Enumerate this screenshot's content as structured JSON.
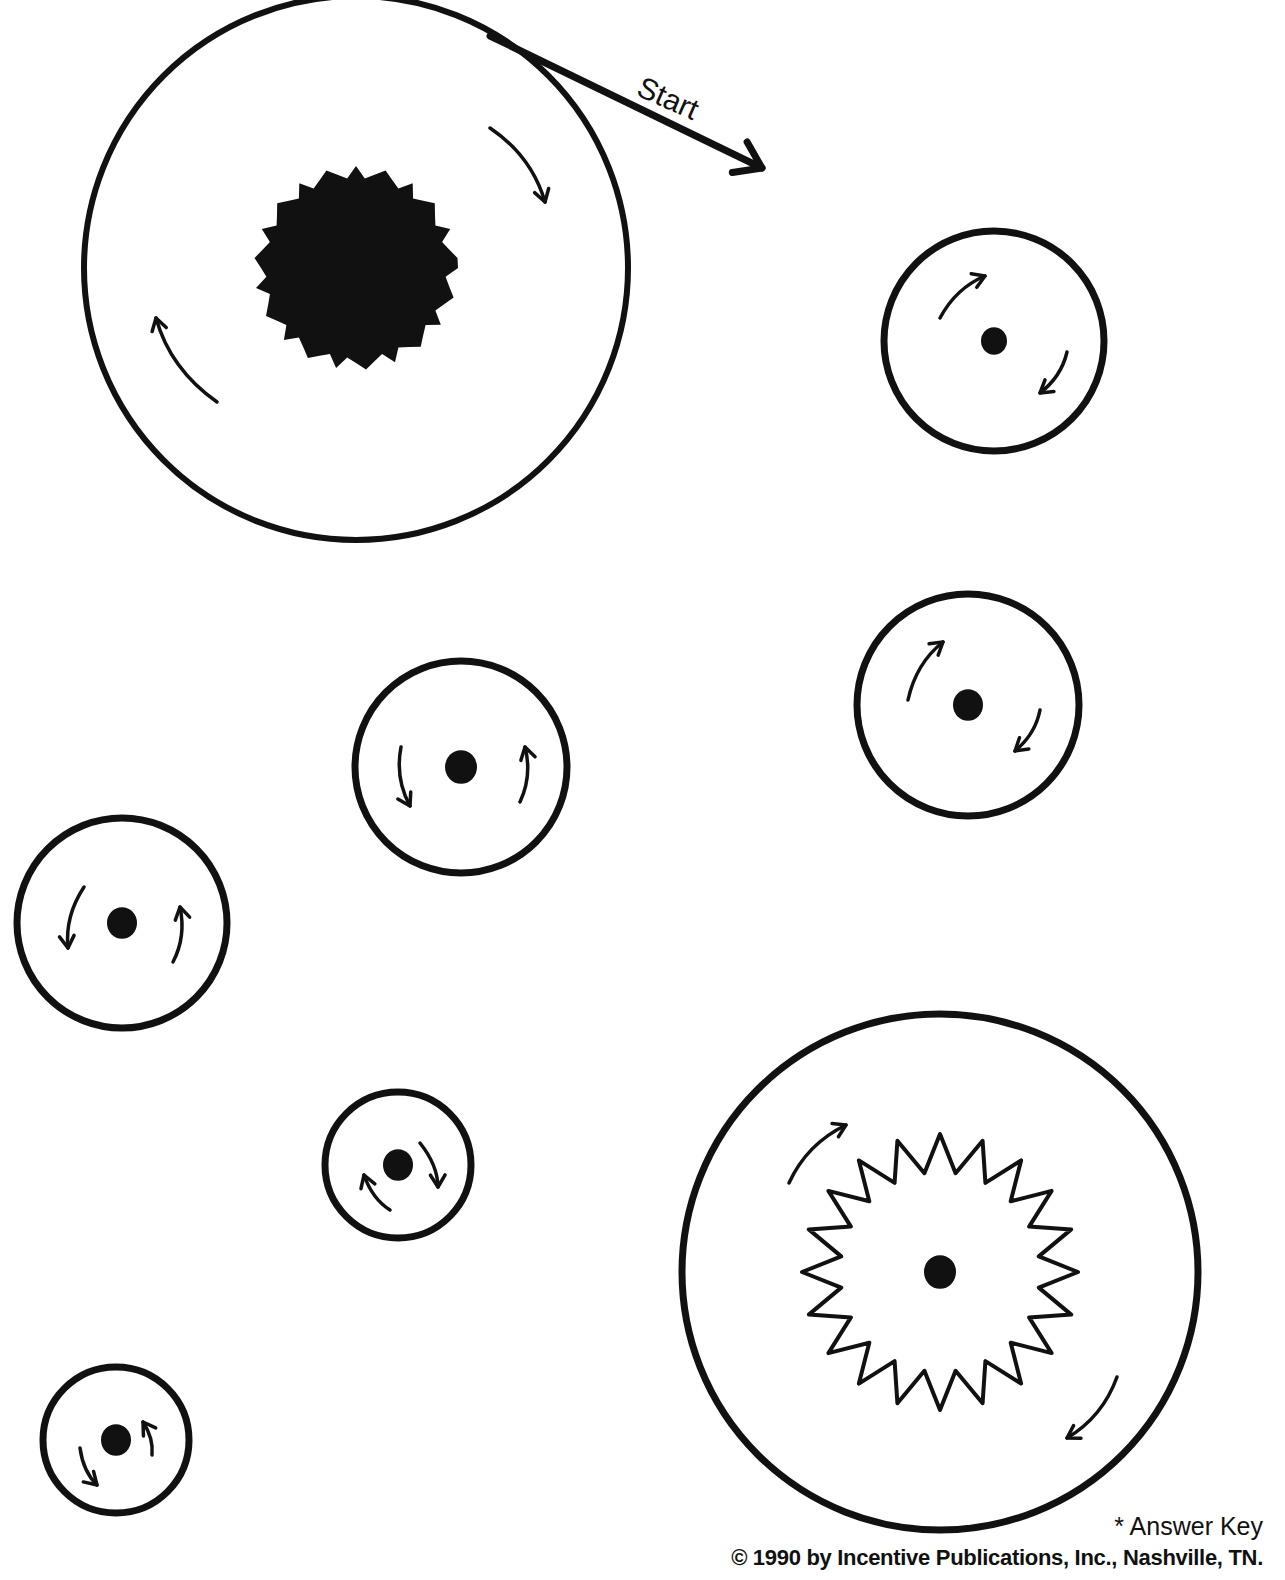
{
  "page": {
    "type": "maze-worksheet",
    "start_label": "Start",
    "answer_key_label": "* Answer Key",
    "copyright": "© 1990 by Incentive Publications, Inc., Nashville, TN."
  },
  "colors": {
    "ink": "#111111",
    "paper": "#ffffff"
  },
  "circles": [
    {
      "id": "large-top-left",
      "cx": 356,
      "cy": 268,
      "r": 272,
      "stroke": 6,
      "center": "fuzzy-blob",
      "center_r": 92,
      "arrows": [
        {
          "dir": "cw",
          "from": [
            490,
            128
          ],
          "to": [
            545,
            202
          ]
        },
        {
          "dir": "cw",
          "from": [
            217,
            402
          ],
          "to": [
            156,
            318
          ]
        }
      ]
    },
    {
      "id": "medium-right-1",
      "cx": 994,
      "cy": 341,
      "r": 110,
      "stroke": 7,
      "center": "dot",
      "center_r": 13,
      "arrows": [
        {
          "dir": "cw",
          "from": [
            940,
            318
          ],
          "to": [
            985,
            276
          ]
        },
        {
          "dir": "cw",
          "from": [
            1067,
            352
          ],
          "to": [
            1040,
            393
          ]
        }
      ]
    },
    {
      "id": "medium-right-2",
      "cx": 968,
      "cy": 705,
      "r": 111,
      "stroke": 7,
      "center": "dot",
      "center_r": 15,
      "arrows": [
        {
          "dir": "cw",
          "from": [
            908,
            700
          ],
          "to": [
            943,
            642
          ]
        },
        {
          "dir": "cw",
          "from": [
            1040,
            710
          ],
          "to": [
            1015,
            751
          ]
        }
      ]
    },
    {
      "id": "medium-center",
      "cx": 461,
      "cy": 767,
      "r": 106,
      "stroke": 7,
      "center": "dot",
      "center_r": 16,
      "arrows": [
        {
          "dir": "ccw",
          "from": [
            401,
            747
          ],
          "to": [
            410,
            806
          ]
        },
        {
          "dir": "ccw",
          "from": [
            520,
            802
          ],
          "to": [
            525,
            747
          ]
        }
      ]
    },
    {
      "id": "medium-left",
      "cx": 122,
      "cy": 923,
      "r": 105,
      "stroke": 7,
      "center": "dot",
      "center_r": 15,
      "arrows": [
        {
          "dir": "ccw",
          "from": [
            84,
            887
          ],
          "to": [
            68,
            948
          ]
        },
        {
          "dir": "ccw",
          "from": [
            173,
            962
          ],
          "to": [
            180,
            907
          ]
        }
      ]
    },
    {
      "id": "small-center",
      "cx": 398,
      "cy": 1165,
      "r": 73,
      "stroke": 7,
      "center": "dot",
      "center_r": 15,
      "arrows": [
        {
          "dir": "cw",
          "from": [
            420,
            1143
          ],
          "to": [
            438,
            1187
          ]
        },
        {
          "dir": "cw",
          "from": [
            390,
            1210
          ],
          "to": [
            364,
            1175
          ]
        }
      ]
    },
    {
      "id": "small-bottom-left",
      "cx": 116,
      "cy": 1440,
      "r": 73,
      "stroke": 7,
      "center": "dot",
      "center_r": 15,
      "arrows": [
        {
          "dir": "ccw",
          "from": [
            80,
            1448
          ],
          "to": [
            97,
            1485
          ]
        },
        {
          "dir": "ccw",
          "from": [
            152,
            1455
          ],
          "to": [
            143,
            1422
          ]
        }
      ]
    },
    {
      "id": "large-bottom-right",
      "cx": 940,
      "cy": 1272,
      "r": 258,
      "stroke": 7,
      "center": "dot",
      "center_r": 16,
      "starburst": {
        "inner_r": 100,
        "outer_r": 138,
        "points": 20
      },
      "arrows": [
        {
          "dir": "cw",
          "from": [
            789,
            1183
          ],
          "to": [
            846,
            1125
          ]
        },
        {
          "dir": "cw",
          "from": [
            1117,
            1377
          ],
          "to": [
            1067,
            1438
          ]
        }
      ]
    }
  ],
  "start_line": {
    "from": [
      490,
      36
    ],
    "to": [
      762,
      168
    ]
  }
}
